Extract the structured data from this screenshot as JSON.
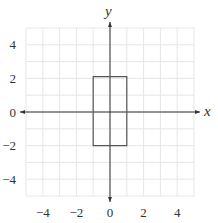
{
  "chart_data": {
    "type": "scatter",
    "title": "",
    "xlabel": "x",
    "ylabel": "y",
    "xlim": [
      -5,
      5
    ],
    "ylim": [
      -5,
      5
    ],
    "grid": true,
    "grid_step": 1,
    "x_ticks": [
      -4,
      -2,
      0,
      2,
      4
    ],
    "y_ticks": [
      4,
      2,
      0,
      -2,
      -4
    ],
    "x_tick_labels": [
      "−4",
      "−2",
      "0",
      "2",
      "4"
    ],
    "y_tick_labels": [
      "4",
      "2",
      "0",
      "−2",
      "−4"
    ],
    "shapes": [
      {
        "type": "rectangle",
        "vertices": [
          [
            -1,
            2.1
          ],
          [
            1,
            2.1
          ],
          [
            1,
            -2
          ],
          [
            -1,
            -2
          ]
        ],
        "stroke": "#555555",
        "fill": "none"
      }
    ],
    "colors": {
      "grid": "#e6e6e6",
      "axis": "#333333",
      "shape": "#555555"
    }
  }
}
